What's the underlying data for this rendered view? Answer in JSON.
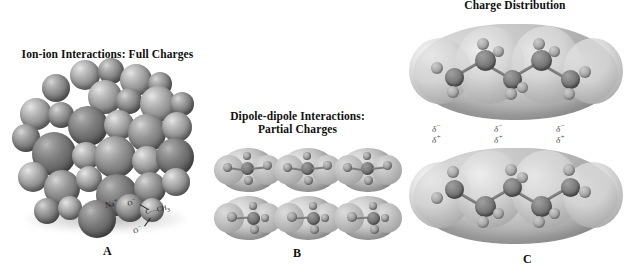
{
  "figure": {
    "background": "#ffffff",
    "width": 635,
    "height": 277
  },
  "panels": [
    {
      "id": "A",
      "title": "Ion-ion Interactions: Full Charges",
      "letter": "A",
      "description": "space-filling ionic crystal lattice of gray spheres",
      "callout": {
        "cation": "Na",
        "cation_charge": "+",
        "oxygen_top": "O",
        "oxygen_top_charge": "−",
        "oxygen_bottom": "O",
        "oxygen_bottom_charge": "−",
        "carbon": "C",
        "methyl": "CH",
        "methyl_sub": "3",
        "bond_dash": "—"
      }
    },
    {
      "id": "B",
      "title_line1": "Dipole-dipole Interactions:",
      "title_line2": "Partial Charges",
      "letter": "B",
      "description": "grid of six polar molecules with electron density surfaces",
      "rows": 2,
      "columns": 3
    },
    {
      "id": "C",
      "title": "Charge Distribution",
      "letter": "C",
      "description": "two stacked hydrocarbon chains with electron density clouds",
      "molecules": 2,
      "charge_labels": [
        {
          "negative": "δ",
          "negative_sign": "−",
          "positive": "δ",
          "positive_sign": "+"
        },
        {
          "negative": "δ",
          "negative_sign": "−",
          "positive": "δ",
          "positive_sign": "+"
        },
        {
          "negative": "δ",
          "negative_sign": "−",
          "positive": "δ",
          "positive_sign": "+"
        }
      ]
    }
  ],
  "colors": {
    "background": "#ffffff",
    "text": "#101010",
    "sphere_mid": "#8e8e8e",
    "sphere_dark": "#5c5c5c",
    "sphere_light": "#d8d8d8",
    "cloud": "#bdbdbd",
    "delta_text": "#4a4a4a"
  }
}
